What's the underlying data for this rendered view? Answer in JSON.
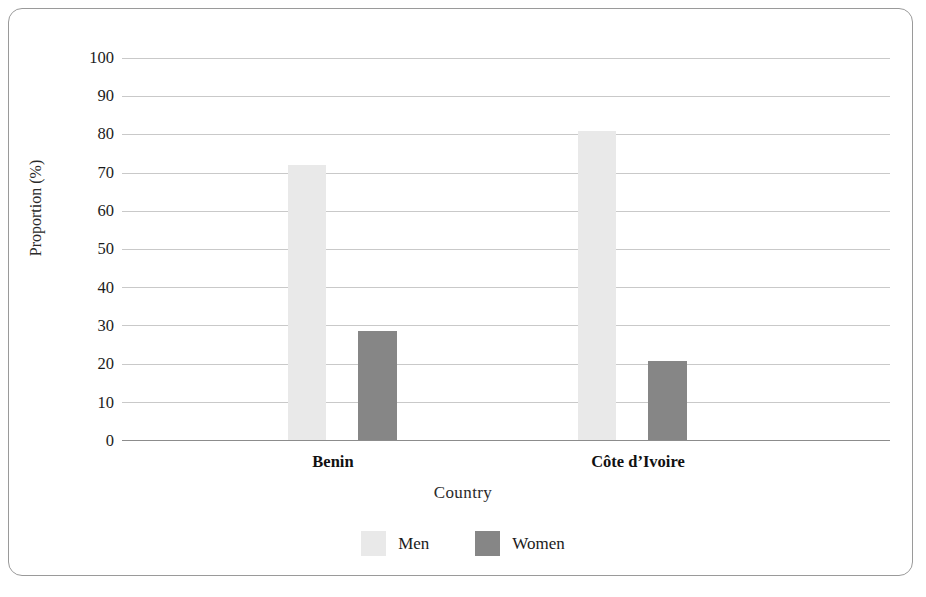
{
  "chart_data": {
    "type": "bar",
    "title": "",
    "subtitle": "",
    "xlabel": "Country",
    "ylabel": "Proportion (%)",
    "categories": [
      "Benin",
      "Côte d’Ivoire"
    ],
    "series": [
      {
        "name": "Men",
        "values": [
          72.0,
          80.8
        ],
        "color": "#e9e9e9"
      },
      {
        "name": "Women",
        "values": [
          28.5,
          20.8
        ],
        "color": "#868686"
      }
    ],
    "ylim": [
      0,
      100
    ],
    "yticks": [
      0,
      10,
      20,
      30,
      40,
      50,
      60,
      70,
      80,
      90,
      100
    ],
    "ytick_labels": [
      "0",
      "10",
      "20",
      "30",
      "40",
      "50",
      "60",
      "70",
      "80",
      "90",
      "100"
    ],
    "grid": "horizontal",
    "legend_position": "bottom-center",
    "frame": {
      "border_color": "#9a9a9a",
      "rounded": true
    },
    "gridline_color": "#c9c9c9",
    "axis_color": "#8c8c8c",
    "background": "#ffffff"
  },
  "legend": {
    "entries": [
      {
        "label": "Men",
        "swatch": "men"
      },
      {
        "label": "Women",
        "swatch": "women"
      }
    ]
  }
}
